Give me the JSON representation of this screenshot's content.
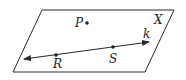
{
  "diagram": {
    "type": "geometry-plane",
    "plane": {
      "label": "X",
      "corners": [
        [
          42,
          10
        ],
        [
          174,
          10
        ],
        [
          145,
          72
        ],
        [
          13,
          72
        ]
      ]
    },
    "line": {
      "label": "k",
      "from": [
        24,
        59
      ],
      "to": [
        149,
        42
      ]
    },
    "points": [
      {
        "label": "P",
        "x": 87,
        "y": 23,
        "label_x": 75,
        "label_y": 27
      },
      {
        "label": "R",
        "x": 56,
        "y": 55,
        "label_x": 53,
        "label_y": 68
      },
      {
        "label": "S",
        "x": 113,
        "y": 47,
        "label_x": 109,
        "label_y": 63
      }
    ],
    "colors": {
      "stroke": "#2a2a2a",
      "background": "#ffffff"
    }
  }
}
